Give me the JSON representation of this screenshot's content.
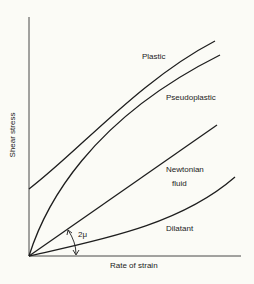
{
  "diagram": {
    "axes": {
      "x_label": "Rate of strain",
      "y_label": "Shear stress"
    },
    "curves": [
      {
        "name": "Plastic",
        "label": "Plastic",
        "shape": "concave-down, nonzero yield intercept"
      },
      {
        "name": "Pseudoplastic",
        "label": "Pseudoplastic",
        "shape": "concave-down through origin"
      },
      {
        "name": "Newtonian fluid",
        "label_line1": "Newtonian",
        "label_line2": "fluid",
        "shape": "straight line through origin"
      },
      {
        "name": "Dilatant",
        "label": "Dilatant",
        "shape": "concave-up through origin"
      }
    ],
    "angle_annotation": "2μ",
    "colors": {
      "line": "#1e1e1e",
      "background": "#fbfbf6",
      "text": "#222222"
    }
  }
}
